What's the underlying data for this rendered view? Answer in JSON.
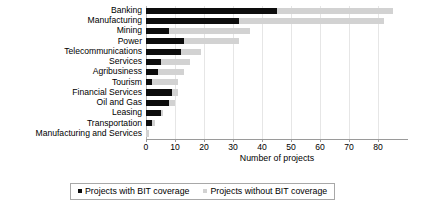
{
  "chart_data": {
    "type": "bar",
    "orientation": "horizontal",
    "stacked": true,
    "title": "",
    "xlabel": "Number of projects",
    "ylabel": "",
    "xlim": [
      0,
      90
    ],
    "xticks": [
      0,
      10,
      20,
      30,
      40,
      50,
      60,
      70,
      80
    ],
    "grid": true,
    "legend_position": "bottom",
    "categories": [
      "Banking",
      "Manufacturing",
      "Mining",
      "Power",
      "Telecommunications",
      "Services",
      "Agribusiness",
      "Tourism",
      "Financial Services",
      "Oil and Gas",
      "Leasing",
      "Transportation",
      "Manufacturing and Services"
    ],
    "series": [
      {
        "name": "Projects with BIT coverage",
        "color": "#0d0d0d",
        "values": [
          45,
          32,
          8,
          13,
          12,
          5,
          4,
          2,
          9,
          8,
          5,
          2,
          0
        ]
      },
      {
        "name": "Projects without BIT coverage",
        "color": "#d2d2d2",
        "values": [
          40,
          50,
          28,
          19,
          7,
          10,
          9,
          9,
          2,
          2,
          1,
          1,
          1
        ]
      }
    ],
    "totals": [
      85,
      82,
      36,
      32,
      19,
      15,
      13,
      11,
      11,
      10,
      6,
      3,
      1
    ]
  },
  "axis": {
    "x_title": "Number of projects",
    "tick_labels": [
      "0",
      "10",
      "20",
      "30",
      "40",
      "50",
      "60",
      "70",
      "80"
    ]
  },
  "legend": {
    "entries": [
      {
        "label": "Projects with BIT coverage",
        "color": "#0d0d0d"
      },
      {
        "label": "Projects without BIT coverage",
        "color": "#d2d2d2"
      }
    ]
  }
}
